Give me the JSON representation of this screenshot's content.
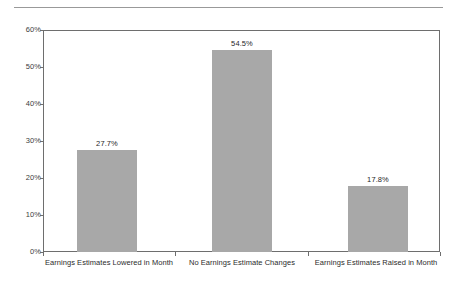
{
  "chart_data": {
    "type": "bar",
    "title": "",
    "subtitle": "",
    "xlabel": "",
    "ylabel": "",
    "categories": [
      "Earnings Estimates Lowered in Month",
      "No Earnings Estimate Changes",
      "Earnings Estimates Raised in Month"
    ],
    "values": [
      27.7,
      54.5,
      17.8
    ],
    "value_labels": [
      "27.7%",
      "54.5%",
      "17.8%"
    ],
    "ylim": [
      0,
      60
    ],
    "ytick_values": [
      60,
      50,
      40,
      30,
      20,
      10,
      0
    ],
    "ytick_labels": [
      "60%",
      "50%",
      "40%",
      "30%",
      "20%",
      "10%",
      "0%"
    ],
    "grid": false,
    "legend": null,
    "legend_position": "none",
    "bar_color": "#a8a8a8",
    "axis_color": "#6e6e6e",
    "text_color": "#2b2b2b",
    "background_color": "#ffffff"
  },
  "decor": {
    "top_rule_color": "#999999"
  }
}
